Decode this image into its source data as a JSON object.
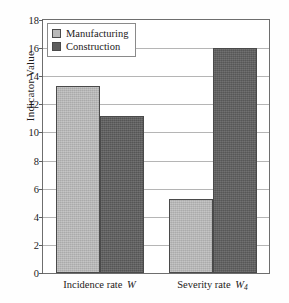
{
  "chart_data": {
    "type": "bar",
    "title": "",
    "xlabel": "",
    "ylabel": "Indicator Value",
    "ylim": [
      0,
      18
    ],
    "ytick_step": 2,
    "yticks": [
      0,
      2,
      4,
      6,
      8,
      10,
      12,
      14,
      16,
      18
    ],
    "grid": true,
    "legend_position": "upper left",
    "categories": [
      "Incidence rate W",
      "Severity rate W4"
    ],
    "category_parts": [
      {
        "text": "Incidence rate",
        "symbol": "W",
        "subscript": ""
      },
      {
        "text": "Severity rate",
        "symbol": "W",
        "subscript": "4"
      }
    ],
    "series": [
      {
        "name": "Manufacturing",
        "color": "#b9b9b9",
        "values": [
          13.3,
          5.3
        ]
      },
      {
        "name": "Construction",
        "color": "#5e5e5e",
        "values": [
          11.15,
          16.0
        ]
      }
    ]
  },
  "legend": {
    "items": [
      {
        "label": "Manufacturing",
        "swatch": "light"
      },
      {
        "label": "Construction",
        "swatch": "dark"
      }
    ]
  },
  "axis": {
    "y_title": "Indicator Value"
  }
}
